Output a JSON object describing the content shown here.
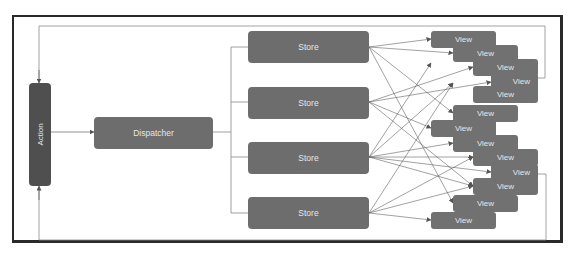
{
  "diagram": {
    "type": "flux-architecture",
    "nodes": {
      "action": {
        "label": "Action"
      },
      "dispatcher": {
        "label": "Dispatcher"
      },
      "stores": [
        {
          "label": "Store"
        },
        {
          "label": "Store"
        },
        {
          "label": "Store"
        },
        {
          "label": "Store"
        }
      ],
      "views": [
        {
          "label": "View"
        },
        {
          "label": "View"
        },
        {
          "label": "View"
        },
        {
          "label": "View"
        },
        {
          "label": "View"
        },
        {
          "label": "View"
        },
        {
          "label": "View"
        },
        {
          "label": "View"
        },
        {
          "label": "View"
        },
        {
          "label": "View"
        },
        {
          "label": "View"
        },
        {
          "label": "View"
        },
        {
          "label": "View"
        },
        {
          "label": "View"
        }
      ]
    },
    "edges": [
      {
        "from": "action",
        "to": "dispatcher"
      },
      {
        "from": "dispatcher",
        "to": "stores"
      },
      {
        "from": "stores",
        "to": "views",
        "style": "many-to-many"
      },
      {
        "from": "views",
        "to": "action",
        "style": "feedback-loop"
      }
    ],
    "colors": {
      "node_fill": "#6d6d6d",
      "action_fill": "#4f4f4f",
      "node_text": "#e6e6e6",
      "edge": "#555555",
      "frame": "#2a2a2a"
    }
  }
}
